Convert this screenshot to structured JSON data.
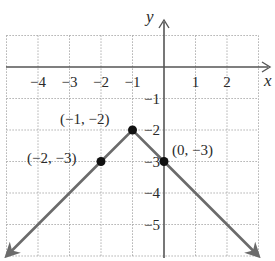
{
  "chart_data": {
    "type": "line",
    "title": "",
    "xlabel": "x",
    "ylabel": "y",
    "xlim": [
      -5,
      3
    ],
    "ylim": [
      -6,
      1
    ],
    "grid": true,
    "x_ticks": [
      -4,
      -3,
      -2,
      -1,
      1,
      2
    ],
    "y_ticks": [
      -1,
      -2,
      -3,
      -4,
      -5
    ],
    "x_tick_labels": [
      "−4",
      "−3",
      "−2",
      "−1",
      "1",
      "2"
    ],
    "y_tick_labels": [
      "−1",
      "−2",
      "−3",
      "−4",
      "−5"
    ],
    "series": [
      {
        "name": "V-shaped graph (y = −|x + 1| − 2)",
        "x": [
          -5,
          -2,
          -1,
          0,
          3
        ],
        "y": [
          -6,
          -3,
          -2,
          -3,
          -6
        ],
        "arrows_at_ends": true,
        "color": "#6b6b6b"
      }
    ],
    "points": [
      {
        "x": -1,
        "y": -2,
        "label": "(−1, −2)"
      },
      {
        "x": -2,
        "y": -3,
        "label": "(−2, −3)"
      },
      {
        "x": 0,
        "y": -3,
        "label": "(0, −3)"
      }
    ]
  },
  "colors": {
    "grid": "#9a9a9a",
    "axis": "#555555",
    "line": "#6b6b6b",
    "point": "#111111",
    "text": "#2a2a2a"
  }
}
